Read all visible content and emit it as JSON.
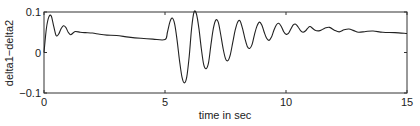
{
  "chart_data": {
    "type": "line",
    "title": "",
    "xlabel": "time in sec",
    "ylabel": "delta1−delta2",
    "xlim": [
      0,
      15
    ],
    "ylim": [
      -0.1,
      0.1
    ],
    "xticks": [
      0,
      5,
      10,
      15
    ],
    "xtick_labels": [
      "0",
      "5",
      "10",
      "15"
    ],
    "yticks": [
      -0.1,
      0,
      0.1
    ],
    "ytick_labels": [
      "−0.1",
      "0",
      "0.1"
    ],
    "grid": false,
    "legend": null,
    "series": [
      {
        "name": "delta1-delta2",
        "color": "#222222",
        "x": [
          0,
          0.1,
          0.2,
          0.3,
          0.4,
          0.5,
          0.6,
          0.7,
          0.8,
          0.9,
          1.0,
          1.1,
          1.2,
          1.3,
          1.5,
          1.7,
          2.0,
          2.3,
          2.6,
          3.0,
          3.5,
          4.0,
          4.5,
          5.0,
          5.1,
          5.2,
          5.3,
          5.4,
          5.5,
          5.6,
          5.7,
          5.8,
          5.9,
          6.0,
          6.1,
          6.2,
          6.3,
          6.4,
          6.5,
          6.6,
          6.7,
          6.8,
          6.9,
          7.0,
          7.1,
          7.2,
          7.3,
          7.4,
          7.5,
          7.6,
          7.7,
          7.8,
          7.9,
          8.0,
          8.1,
          8.2,
          8.3,
          8.4,
          8.5,
          8.6,
          8.7,
          8.8,
          8.9,
          9.0,
          9.1,
          9.2,
          9.3,
          9.4,
          9.5,
          9.6,
          9.7,
          9.8,
          9.9,
          10.0,
          10.1,
          10.2,
          10.3,
          10.4,
          10.5,
          10.6,
          10.7,
          10.8,
          10.9,
          11.0,
          11.2,
          11.4,
          11.6,
          11.8,
          12.0,
          12.2,
          12.4,
          12.6,
          12.8,
          13.0,
          13.3,
          13.6,
          14.0,
          14.5,
          15.0
        ],
        "y": [
          0.0,
          0.06,
          0.088,
          0.09,
          0.065,
          0.042,
          0.045,
          0.058,
          0.066,
          0.062,
          0.05,
          0.044,
          0.048,
          0.052,
          0.05,
          0.049,
          0.048,
          0.045,
          0.043,
          0.042,
          0.038,
          0.035,
          0.033,
          0.032,
          0.05,
          0.075,
          0.085,
          0.07,
          0.03,
          -0.02,
          -0.06,
          -0.075,
          -0.06,
          -0.01,
          0.06,
          0.1,
          0.095,
          0.06,
          0.01,
          -0.03,
          -0.04,
          -0.025,
          0.02,
          0.06,
          0.08,
          0.075,
          0.045,
          0.01,
          -0.015,
          -0.02,
          -0.005,
          0.025,
          0.055,
          0.075,
          0.078,
          0.06,
          0.035,
          0.015,
          0.01,
          0.02,
          0.045,
          0.065,
          0.075,
          0.068,
          0.05,
          0.035,
          0.03,
          0.038,
          0.055,
          0.068,
          0.072,
          0.065,
          0.052,
          0.045,
          0.047,
          0.058,
          0.068,
          0.07,
          0.063,
          0.054,
          0.05,
          0.053,
          0.06,
          0.064,
          0.055,
          0.054,
          0.06,
          0.062,
          0.055,
          0.051,
          0.056,
          0.058,
          0.054,
          0.05,
          0.052,
          0.053,
          0.05,
          0.049,
          0.047
        ]
      }
    ]
  }
}
